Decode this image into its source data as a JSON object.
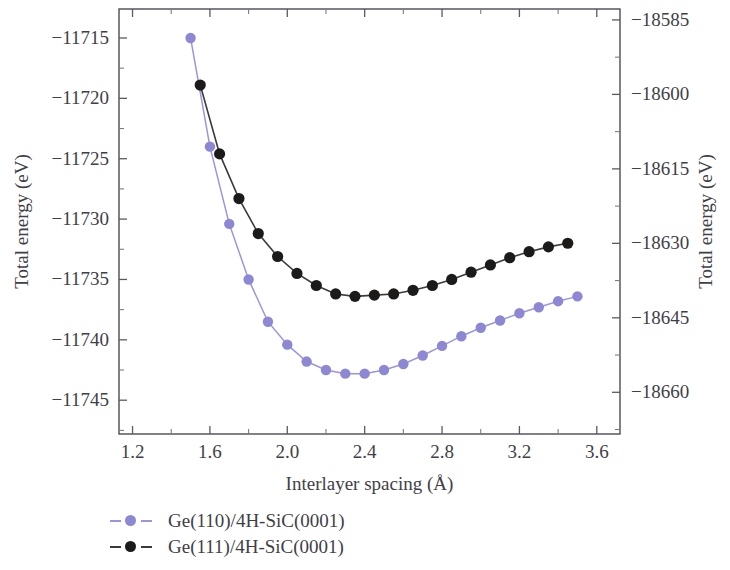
{
  "chart_data": {
    "type": "line",
    "title": "",
    "xlabel": "Interlayer spacing (Å)",
    "ylabel": "Total energy (eV)",
    "ylabel_right": "Total energy (eV)",
    "xlim": [
      1.13,
      3.72
    ],
    "ylim": [
      -11747.8,
      -11712.6
    ],
    "ylim_right": [
      -18668.4,
      -18582.8
    ],
    "xticks": [
      "1.2",
      "1.6",
      "2.0",
      "2.4",
      "2.8",
      "3.2",
      "3.6"
    ],
    "xtick_values": [
      1.2,
      1.6,
      2.0,
      2.4,
      2.8,
      3.2,
      3.6
    ],
    "yticks": [
      "−11715",
      "−11720",
      "−11725",
      "−11730",
      "−11735",
      "−11740",
      "−11745"
    ],
    "ytick_values": [
      -11715,
      -11720,
      -11725,
      -11730,
      -11735,
      -11740,
      -11745
    ],
    "yticks_right": [
      "−18585",
      "−18600",
      "−18615",
      "−18630",
      "−18645",
      "−18660"
    ],
    "ytick_values_right": [
      -18585,
      -18600,
      -18615,
      -18630,
      -18645,
      -18660
    ],
    "minor_ticks": true,
    "grid": false,
    "legend_position": "below-left",
    "series": [
      {
        "name": "Ge(110)/4H-SiC(0001)",
        "color": "#8d87d4",
        "line_color": "#9a95dd",
        "marker": "circle",
        "axis": "left",
        "x": [
          1.5,
          1.6,
          1.7,
          1.8,
          1.9,
          2.0,
          2.1,
          2.2,
          2.3,
          2.4,
          2.5,
          2.6,
          2.7,
          2.8,
          2.9,
          3.0,
          3.1,
          3.2,
          3.3,
          3.4,
          3.5
        ],
        "y": [
          -11715.0,
          -11724.0,
          -11730.4,
          -11735.0,
          -11738.5,
          -11740.4,
          -11741.8,
          -11742.5,
          -11742.8,
          -11742.8,
          -11742.5,
          -11742.0,
          -11741.3,
          -11740.5,
          -11739.7,
          -11739.0,
          -11738.4,
          -11737.8,
          -11737.3,
          -11736.8,
          -11736.4
        ]
      },
      {
        "name": "Ge(111)/4H-SiC(0001)",
        "color": "#1d1b1a",
        "line_color": "#3b3b3b",
        "marker": "circle",
        "axis": "right",
        "x": [
          1.55,
          1.65,
          1.75,
          1.85,
          1.95,
          2.05,
          2.15,
          2.25,
          2.35,
          2.45,
          2.55,
          2.65,
          2.75,
          2.85,
          2.95,
          3.05,
          3.15,
          3.25,
          3.35,
          3.45
        ],
        "y": [
          -11718.9,
          -11724.6,
          -11728.3,
          -11731.2,
          -11733.1,
          -11734.5,
          -11735.5,
          -11736.2,
          -11736.4,
          -11736.3,
          -11736.2,
          -11735.9,
          -11735.5,
          -11735.0,
          -11734.4,
          -11733.8,
          -11733.2,
          -11732.7,
          -11732.3,
          -11732.0
        ]
      }
    ]
  },
  "legend": {
    "items": [
      {
        "label": "Ge(110)/4H-SiC(0001)",
        "color": "#8d87d4",
        "line_color": "#9a95dd"
      },
      {
        "label": "Ge(111)/4H-SiC(0001)",
        "color": "#1d1b1a",
        "line_color": "#3b3b3b"
      }
    ]
  }
}
